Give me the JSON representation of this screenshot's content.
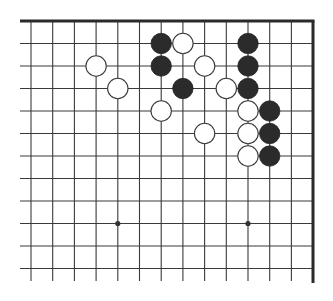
{
  "diagram": {
    "type": "go-board-fragment",
    "colors": {
      "background": "#ffffff",
      "grid_line": "#3a3a3a",
      "edge_line": "#2a2a2a",
      "black_stone": "#2b2b2b",
      "white_stone_fill": "#ffffff",
      "white_stone_stroke": "#3a3a3a",
      "star_point": "#333333"
    },
    "grid": {
      "columns_x": [
        31,
        52.7,
        74.4,
        96.1,
        117.8,
        139.5,
        161.2,
        182.9,
        204.6,
        226.3,
        248,
        269.7,
        291.4,
        313
      ],
      "rows_y": [
        21,
        43.5,
        66,
        88.5,
        111,
        133.5,
        156,
        178.5,
        201,
        223.5,
        246,
        268.5
      ],
      "line_bottom_y": 281,
      "line_left_x": 20,
      "top_edge": true,
      "right_edge": true
    },
    "star_points": [
      {
        "col": 4,
        "row": 9
      },
      {
        "col": 10,
        "row": 9
      }
    ],
    "stones": [
      {
        "color": "black",
        "col": 6,
        "row": 1
      },
      {
        "color": "white",
        "col": 7,
        "row": 1
      },
      {
        "color": "black",
        "col": 10,
        "row": 1
      },
      {
        "color": "white",
        "col": 3,
        "row": 2
      },
      {
        "color": "black",
        "col": 6,
        "row": 2
      },
      {
        "color": "white",
        "col": 8,
        "row": 2
      },
      {
        "color": "black",
        "col": 10,
        "row": 2
      },
      {
        "color": "white",
        "col": 4,
        "row": 3
      },
      {
        "color": "black",
        "col": 7,
        "row": 3
      },
      {
        "color": "white",
        "col": 9,
        "row": 3
      },
      {
        "color": "black",
        "col": 10,
        "row": 3
      },
      {
        "color": "white",
        "col": 6,
        "row": 4
      },
      {
        "color": "white",
        "col": 10,
        "row": 4
      },
      {
        "color": "black",
        "col": 11,
        "row": 4
      },
      {
        "color": "white",
        "col": 8,
        "row": 5
      },
      {
        "color": "white",
        "col": 10,
        "row": 5
      },
      {
        "color": "black",
        "col": 11,
        "row": 5
      },
      {
        "color": "white",
        "col": 10,
        "row": 6
      },
      {
        "color": "black",
        "col": 11,
        "row": 6
      }
    ],
    "stone_radius": 10.2
  }
}
